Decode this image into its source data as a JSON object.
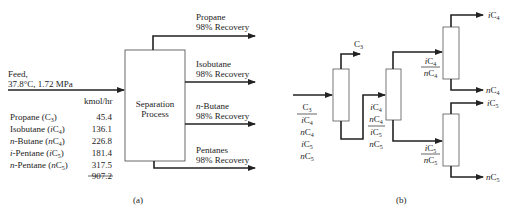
{
  "panel_a": {
    "caption": "(a)",
    "feed_label_line1": "Feed,",
    "feed_label_line2": "37.8°C, 1.72 MPa",
    "units_header": "kmol/hr",
    "components": [
      {
        "name": "Propane (C",
        "sub": "3",
        "close": ")",
        "italic_prefix": "",
        "value": "45.4"
      },
      {
        "name": "Isobutane (",
        "italic": "i",
        "mid": "C",
        "sub": "4",
        "close": ")",
        "value": "136.1"
      },
      {
        "name": "-Butane (",
        "italic_prefix": "n",
        "italic": "n",
        "mid": "C",
        "sub": "4",
        "close": ")",
        "value": "226.8"
      },
      {
        "name": "-Pentane (",
        "italic_prefix": "i",
        "italic": "i",
        "mid": "C",
        "sub": "5",
        "close": ")",
        "value": "181.4"
      },
      {
        "name": "-Pentane (",
        "italic_prefix": "n",
        "italic": "n",
        "mid": "C",
        "sub": "5",
        "close": ")",
        "value": "317.5"
      }
    ],
    "total": "907.2",
    "process_label_line1": "Separation",
    "process_label_line2": "Process",
    "products": [
      {
        "name": "Propane",
        "recovery": "98% Recovery"
      },
      {
        "name": "Isobutane",
        "recovery": "98% Recovery"
      },
      {
        "name": "-Butane",
        "italic_prefix": "n",
        "recovery": "98% Recovery"
      },
      {
        "name": "Pentanes",
        "recovery": "98% Recovery"
      }
    ]
  },
  "panel_b": {
    "caption": "(b)",
    "feed_stack": [
      "C3",
      "iC4",
      "nC4",
      "iC5",
      "nC5"
    ],
    "column1_top": "C3",
    "column2_feed_stack": [
      "iC4",
      "nC4",
      "iC5",
      "nC5"
    ],
    "column3_feed": [
      "iC4",
      "nC4"
    ],
    "column3_top": "iC4",
    "column3_bottom": "nC4",
    "column4_feed": [
      "iC5",
      "nC5"
    ],
    "column4_top": "iC5",
    "column4_bottom": "nC5"
  }
}
